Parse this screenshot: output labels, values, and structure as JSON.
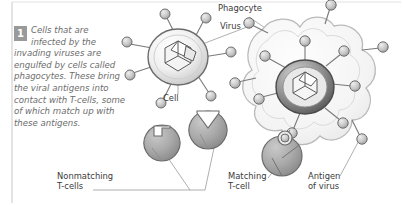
{
  "figure": {
    "type": "immune-response-diagram",
    "width": 403,
    "height": 205,
    "background_color": "#ffffff",
    "frame_border_color": "#c9c9c9"
  },
  "caption": {
    "step_number": "1",
    "badge_color": "#9a9a9a",
    "text_color": "#6d6d6d",
    "text": "Cells that are infected by the invading viruses are engulfed by cells called phagocytes. These bring the viral antigens into contact with T-cells, some of which match up with these antigens."
  },
  "labels": {
    "phagocyte": "Phagocyte",
    "virus": "Virus",
    "cell": "Cell",
    "nonmatching_tcells": "Nonmatching\nT-cells",
    "matching_tcell": "Matching\nT-cell",
    "antigen_of_virus": "Antigen\nof virus"
  },
  "palette": {
    "label_text": "#3a3a3a",
    "leader_line": "#9b9b9b",
    "cell_outline": "#6b6b6b",
    "cell_fill_light": "#f2f2f2",
    "cell_fill_mid": "#d4d4d4",
    "infected_cell_dark": "#5f5f5f",
    "phagocyte_outline": "#bdbdbd",
    "phagocyte_fill": "#f7f7f7",
    "tcell_fill": "#a8a8a8",
    "tcell_outline": "#6b6b6b",
    "antigen_pin_fill": "#c2c2c2",
    "antigen_pin_outline": "#6f6f6f",
    "virus_core_outline": "#5a5a5a"
  },
  "structures": {
    "infected_cell_left": {
      "name": "infected cell",
      "center": [
        178,
        55
      ],
      "radius": 29,
      "antigen_pin_count": 7,
      "has_virus_core": true
    },
    "phagocyte": {
      "name": "phagocyte",
      "center": [
        305,
        88
      ],
      "engulfed_cell_center": [
        305,
        88
      ],
      "engulfed_cell_radius": 28,
      "antigen_pin_count": 7,
      "outer_pin_count": 5
    },
    "nonmatching_tcells": [
      {
        "center": [
          162,
          143
        ],
        "radius": 18,
        "notch": "square"
      },
      {
        "center": [
          207,
          130
        ],
        "radius": 19,
        "notch": "v-wedge"
      }
    ],
    "matching_tcell": {
      "center": [
        277,
        158
      ],
      "radius": 20,
      "notch": "round",
      "docked_antigen": true
    }
  }
}
